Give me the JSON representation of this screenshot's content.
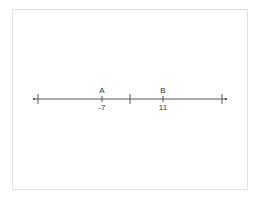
{
  "diagram": {
    "type": "number-line",
    "points": [
      {
        "name": "A",
        "value": "-7"
      },
      {
        "name": "B",
        "value": "11"
      }
    ]
  }
}
